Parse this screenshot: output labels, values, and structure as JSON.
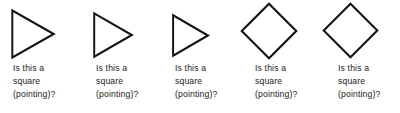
{
  "figure": {
    "background_color": "#ffffff",
    "stroke_color": "#111111",
    "text_color": "#1a1a1a",
    "items": [
      {
        "shape_name": "triangle-pointing-right",
        "caption_lines": [
          "Is this a",
          "square",
          "(pointing)?"
        ],
        "caption_text": "Is this a square (pointing)?",
        "shape_left": 11,
        "shape_top": 9,
        "shape_width": 44,
        "shape_height": 50,
        "caption_left": 13,
        "caption_top": 62
      },
      {
        "shape_name": "triangle-pointing-right",
        "caption_lines": [
          "Is this a",
          "square",
          "(pointing)?"
        ],
        "caption_text": "Is this a square (pointing)?",
        "shape_left": 93,
        "shape_top": 12,
        "shape_width": 40,
        "shape_height": 46,
        "caption_left": 96,
        "caption_top": 62
      },
      {
        "shape_name": "triangle-pointing-right",
        "caption_lines": [
          "Is this a",
          "square",
          "(pointing)?"
        ],
        "caption_text": "Is this a square (pointing)?",
        "shape_left": 172,
        "shape_top": 14,
        "shape_width": 37,
        "shape_height": 43,
        "caption_left": 175,
        "caption_top": 62
      },
      {
        "shape_name": "diamond-square-rotated",
        "caption_lines": [
          "Is this a",
          "square",
          "(pointing)?"
        ],
        "caption_text": "Is this a square (pointing)?",
        "shape_left": 240,
        "shape_top": 2,
        "shape_width": 58,
        "shape_height": 58,
        "caption_left": 255,
        "caption_top": 62
      },
      {
        "shape_name": "diamond-square-rotated",
        "caption_lines": [
          "Is this a",
          "square",
          "(pointing)?"
        ],
        "caption_text": "Is this a square (pointing)?",
        "shape_left": 322,
        "shape_top": 2,
        "shape_width": 57,
        "shape_height": 57,
        "caption_left": 338,
        "caption_top": 62
      }
    ]
  }
}
